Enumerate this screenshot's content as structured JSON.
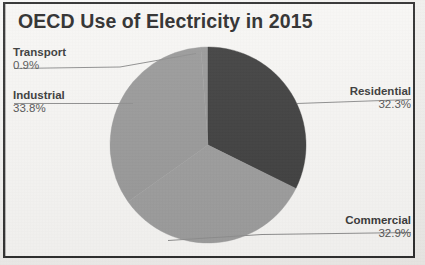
{
  "chart_data": {
    "type": "pie",
    "title": "OECD Use of Electricity in 2015",
    "categories": [
      "Transport",
      "Residential",
      "Commercial",
      "Industrial"
    ],
    "values": [
      0.9,
      32.3,
      32.9,
      33.8
    ],
    "value_labels": [
      "0.9%",
      "32.3%",
      "32.9%",
      "33.8%"
    ],
    "unit": "%",
    "legend": "none",
    "labels_position": "outside-with-leader-lines",
    "slices": [
      {
        "name": "Transport",
        "value": 0.9,
        "value_label": "0.9%",
        "color": "#9a9a9a",
        "start_deg": 355.8,
        "end_deg": 360.0
      },
      {
        "name": "Residential",
        "value": 32.3,
        "value_label": "32.3%",
        "color": "#3f3f3f",
        "start_deg": 0.0,
        "end_deg": 116.3
      },
      {
        "name": "Commercial",
        "value": 32.9,
        "value_label": "32.9%",
        "color": "#9d9d9d",
        "start_deg": 116.3,
        "end_deg": 234.7
      },
      {
        "name": "Industrial",
        "value": 33.8,
        "value_label": "33.8%",
        "color": "#9a9a9a",
        "start_deg": 234.7,
        "end_deg": 355.8
      }
    ],
    "grid": false,
    "xlabel": "",
    "ylabel": ""
  },
  "title": "OECD Use of Electricity in 2015",
  "labels": {
    "transport": {
      "name": "Transport",
      "value": "0.9%"
    },
    "industrial": {
      "name": "Industrial",
      "value": "33.8%"
    },
    "residential": {
      "name": "Residential",
      "value": "32.3%"
    },
    "commercial": {
      "name": "Commercial",
      "value": "32.9%"
    }
  },
  "colors": {
    "dark_slice": "#3f3f3f",
    "light_slice": "#9a9a9a",
    "mid_slice": "#9d9d9d",
    "frame": "#2e2e2e",
    "paper": "#f7f6f4",
    "text": "#2b2b2b",
    "leader_line": "#8c8c8c"
  }
}
